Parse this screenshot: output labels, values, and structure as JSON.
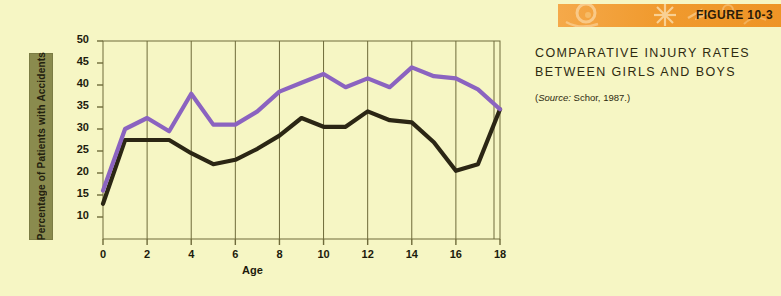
{
  "figure": {
    "banner_label": "FIGURE 10-3",
    "title_line1": "COMPARATIVE INJURY RATES",
    "title_line2": "BETWEEN GIRLS AND BOYS",
    "source_prefix": "(",
    "source_italic": "Source:",
    "source_text": " Schor, 1987.)"
  },
  "colors": {
    "background": "#F6F6C4",
    "boys": "#8B63C0",
    "girls": "#2B2614",
    "axis": "#6E6A3A",
    "grid": "#6E6A3A",
    "label_box": "#8A8B4E",
    "banner_orange": "#F09A2E",
    "text": "#1D1B0C"
  },
  "legend": {
    "position": "right",
    "items": [
      {
        "label": "Boys",
        "color": "#8B63C0",
        "swatch": "boys-swatch"
      },
      {
        "label": "Girls",
        "color": "#2B2614",
        "swatch": "girls-swatch"
      }
    ]
  },
  "chart_data": {
    "type": "line",
    "title": "COMPARATIVE INJURY RATES BETWEEN GIRLS AND BOYS",
    "subtitle": "(Source: Schor, 1987.)",
    "xlabel": "Age",
    "ylabel": "Percentage of Patients with Accidents",
    "xlim": [
      0,
      18
    ],
    "ylim": [
      8,
      51
    ],
    "xticks": [
      0,
      2,
      4,
      6,
      8,
      10,
      12,
      14,
      16,
      18
    ],
    "yticks": [
      10,
      15,
      20,
      25,
      30,
      35,
      40,
      45,
      50
    ],
    "grid": "vertical-only",
    "x": [
      0,
      1,
      2,
      3,
      4,
      5,
      6,
      7,
      8,
      9,
      10,
      11,
      12,
      13,
      14,
      15,
      16,
      17,
      18
    ],
    "series": [
      {
        "name": "Boys",
        "color": "#8B63C0",
        "values": [
          16,
          30,
          32.5,
          29.5,
          38,
          31,
          31,
          34,
          38.5,
          40.5,
          42.5,
          39.5,
          41.5,
          39.5,
          44,
          42,
          41.5,
          39,
          34.5
        ]
      },
      {
        "name": "Girls",
        "color": "#2B2614",
        "values": [
          13,
          27.5,
          27.5,
          27.5,
          24.5,
          22,
          23,
          25.5,
          28.5,
          32.5,
          30.5,
          30.5,
          34,
          32,
          31.5,
          27,
          20.5,
          22,
          34.5
        ]
      }
    ]
  }
}
